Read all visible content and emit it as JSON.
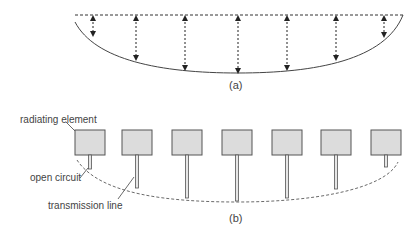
{
  "figure_a": {
    "caption": "(a)",
    "reference_line": {
      "x1": 75,
      "x2": 403,
      "y": 15
    },
    "arrows": [
      {
        "x": 93,
        "y_bottom": 36
      },
      {
        "x": 136,
        "y_bottom": 60
      },
      {
        "x": 185,
        "y_bottom": 70
      },
      {
        "x": 238,
        "y_bottom": 73
      },
      {
        "x": 287,
        "y_bottom": 70
      },
      {
        "x": 336,
        "y_bottom": 60
      },
      {
        "x": 384,
        "y_bottom": 37
      }
    ]
  },
  "figure_b": {
    "caption": "(b)",
    "labels": {
      "radiating_element": "radiating element",
      "open_circuit": "open circuit",
      "transmission_line": "transmission line"
    },
    "elements": [
      {
        "x": 75,
        "line_end": 169
      },
      {
        "x": 122,
        "line_end": 188
      },
      {
        "x": 172,
        "line_end": 198
      },
      {
        "x": 222,
        "line_end": 201
      },
      {
        "x": 272,
        "line_end": 198
      },
      {
        "x": 321,
        "line_end": 189
      },
      {
        "x": 371,
        "line_end": 167
      }
    ],
    "patch": {
      "top": 130,
      "width": 30,
      "height": 25,
      "fill": "#dcdcdc",
      "stroke": "#555555"
    }
  }
}
